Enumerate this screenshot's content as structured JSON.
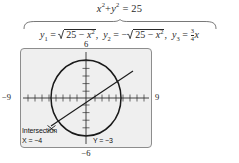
{
  "figure": {
    "type": "graphing-calculator-illustration",
    "top_equation": {
      "lhs_x": "x",
      "lhs_plus": "+",
      "lhs_y": "y",
      "equals": "=",
      "rhs": "25",
      "exponent": "2",
      "full_text": "x² + y² = 25"
    },
    "brace_label": "underbrace",
    "equations": [
      {
        "name": "y1",
        "var": "y",
        "sub": "1",
        "equals": "=",
        "sign": "",
        "radicand_a": "25",
        "radicand_op": "−",
        "radicand_b": "x",
        "exponent": "2",
        "separator": ",",
        "full_text": "y₁ = √(25 − x²)"
      },
      {
        "name": "y2",
        "var": "y",
        "sub": "2",
        "equals": "=",
        "sign": "−",
        "radicand_a": "25",
        "radicand_op": "−",
        "radicand_b": "x",
        "exponent": "2",
        "separator": ",",
        "full_text": "y₂ = −√(25 − x²)"
      },
      {
        "name": "y3",
        "var": "y",
        "sub": "3",
        "equals": "=",
        "numerator": "3",
        "denominator": "4",
        "trailing_var": "x",
        "full_text": "y₃ = (3/4)x"
      }
    ],
    "screen": {
      "axis_labels": {
        "top": "6",
        "bottom": "−6",
        "left": "−9",
        "right": "9"
      },
      "window": {
        "xmin": -9,
        "xmax": 9,
        "ymin": -6,
        "ymax": 6
      },
      "readout": {
        "title": "Intersection",
        "x_label": "X = −4",
        "y_label": "Y = −3"
      },
      "curves": {
        "circle": {
          "center_x": 0,
          "center_y": 0,
          "radius": 5
        },
        "line": {
          "slope": 0.75,
          "intercept": 0
        }
      },
      "intersection_point": {
        "x": -4,
        "y": -3
      },
      "colors": {
        "screen_background": "#efefef",
        "screen_border": "#8d8d8d",
        "curve": "#1a1a1a",
        "axis": "#2f2f2f"
      }
    }
  }
}
